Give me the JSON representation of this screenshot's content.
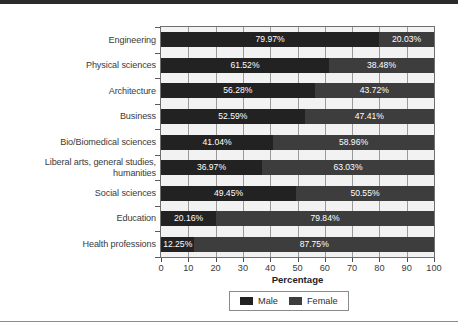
{
  "chart_data": {
    "type": "bar",
    "orientation": "horizontal",
    "stacked": true,
    "normalized": true,
    "title": "",
    "xlabel": "Percentage",
    "ylabel": "",
    "xlim": [
      0,
      100
    ],
    "xticks": [
      0,
      10,
      20,
      30,
      40,
      50,
      60,
      70,
      80,
      90,
      100
    ],
    "xtick_labels": [
      "0",
      "10",
      "20",
      "30",
      "40",
      "50",
      "60",
      "70",
      "80",
      "90",
      "100"
    ],
    "grid": true,
    "grid_axis": "x",
    "legend_position": "bottom-center",
    "categories": [
      "Engineering",
      "Physical sciences",
      "Architecture",
      "Business",
      "Bio/Biomedical sciences",
      "Liberal arts, general studies, humanities",
      "Social sciences",
      "Education",
      "Health professions"
    ],
    "category_label_lines": [
      [
        "Engineering"
      ],
      [
        "Physical sciences"
      ],
      [
        "Architecture"
      ],
      [
        "Business"
      ],
      [
        "Bio/Biomedical sciences"
      ],
      [
        "Liberal arts, general studies,",
        "humanities"
      ],
      [
        "Social sciences"
      ],
      [
        "Education"
      ],
      [
        "Health professions"
      ]
    ],
    "series": [
      {
        "name": "Male",
        "color": "#222222",
        "values": [
          79.97,
          61.52,
          56.28,
          52.59,
          41.04,
          36.97,
          49.45,
          20.16,
          12.25
        ],
        "labels": [
          "79.97%",
          "61.52%",
          "56.28%",
          "52.59%",
          "41.04%",
          "36.97%",
          "49.45%",
          "20.16%",
          "12.25%"
        ]
      },
      {
        "name": "Female",
        "color": "#3d3d3d",
        "values": [
          20.03,
          38.48,
          43.72,
          47.41,
          58.96,
          63.03,
          50.55,
          79.84,
          87.75
        ],
        "labels": [
          "20.03%",
          "38.48%",
          "43.72%",
          "47.41%",
          "58.96%",
          "63.03%",
          "50.55%",
          "79.84%",
          "87.75%"
        ]
      }
    ],
    "legend_entries": [
      {
        "label": "Male",
        "color": "#222222"
      },
      {
        "label": "Female",
        "color": "#3d3d3d"
      }
    ]
  }
}
